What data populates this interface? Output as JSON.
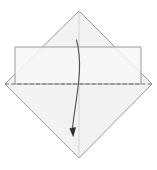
{
  "diagram": {
    "title": "Origami fold step diagram",
    "canvas": {
      "width": 157,
      "height": 170,
      "background": "#ffffff"
    },
    "colors": {
      "paper_fill": "#f2f2f2",
      "paper_fill_light": "#f7f7f7",
      "outline": "#9a9a9a",
      "outline_dark": "#8a8a8a",
      "fold_line": "#6f6f6f",
      "center_line": "#cfcfcf",
      "arrow": "#555555",
      "arrow_head": "#2b2b2b"
    },
    "shapes": {
      "diamond": {
        "name": "square-sheet-diamond",
        "label": "Square sheet rotated 45 degrees",
        "points": "79,11 152,84 79,158 5,84",
        "top_apex": [
          79,
          11
        ],
        "right_apex": [
          152,
          84
        ],
        "bottom_apex": [
          79,
          158
        ],
        "left_apex": [
          5,
          84
        ]
      },
      "rectangle": {
        "name": "flap-band-rectangle",
        "label": "Horizontal rectangular flap band",
        "x": 15,
        "y": 47,
        "width": 126,
        "height": 37,
        "points": "15,47 141,47 141,84 15,84"
      },
      "fold_line": {
        "name": "valley-fold-dashed-line",
        "label": "Horizontal valley fold line",
        "x1": 5,
        "y1": 84,
        "x2": 152,
        "y2": 84,
        "dash": "4,2.2",
        "width": 1
      },
      "center_line": {
        "name": "vertical-center-crease",
        "label": "Faint vertical center crease",
        "x1": 79,
        "y1": 11,
        "x2": 79,
        "y2": 158,
        "width": 0.8
      },
      "arrow": {
        "name": "fold-direction-arrow",
        "label": "Curved arrow showing fold direction downward",
        "path": "M 76.5,40 C 84,68 76,96 72.5,128",
        "start": [
          76.5,
          40
        ],
        "end": [
          72.5,
          128
        ],
        "head_points": "69.8,128.5 75.6,127.4 73.2,136.5",
        "stroke_width": 1.1
      }
    }
  }
}
